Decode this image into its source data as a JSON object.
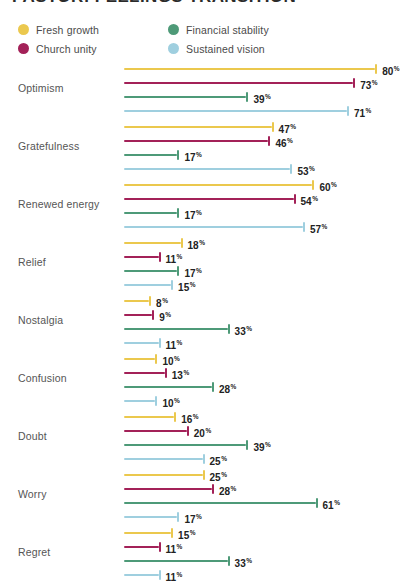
{
  "title": "PASTOR: FEELINGS TRANSITION",
  "legend": {
    "position": "top-left",
    "items": [
      {
        "label": "Fresh growth",
        "color": "#EBC84E"
      },
      {
        "label": "Financial stability",
        "color": "#4E9A78"
      },
      {
        "label": "Church unity",
        "color": "#A32158"
      },
      {
        "label": "Sustained vision",
        "color": "#9FCFDF"
      }
    ]
  },
  "chart_data": {
    "type": "bar",
    "orientation": "horizontal",
    "title": "PASTOR: FEELINGS TRANSITION",
    "xlabel": "",
    "ylabel": "",
    "xlim": [
      0,
      80
    ],
    "grid": false,
    "value_suffix": "%",
    "legend_position": "top-left",
    "categories": [
      "Optimism",
      "Gratefulness",
      "Renewed energy",
      "Relief",
      "Nostalgia",
      "Confusion",
      "Doubt",
      "Worry",
      "Regret"
    ],
    "series": [
      {
        "name": "Fresh growth",
        "color": "#EBC84E",
        "values": [
          80,
          47,
          60,
          18,
          8,
          10,
          16,
          25,
          15
        ]
      },
      {
        "name": "Church unity",
        "color": "#A32158",
        "values": [
          73,
          46,
          54,
          11,
          9,
          13,
          20,
          28,
          11
        ]
      },
      {
        "name": "Financial stability",
        "color": "#4E9A78",
        "values": [
          39,
          17,
          17,
          17,
          33,
          28,
          39,
          61,
          33
        ]
      },
      {
        "name": "Sustained vision",
        "color": "#9FCFDF",
        "values": [
          71,
          53,
          57,
          15,
          11,
          10,
          25,
          17,
          11
        ]
      }
    ]
  }
}
